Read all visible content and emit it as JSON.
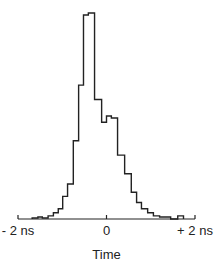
{
  "chart_data": {
    "type": "bar",
    "style": "step-histogram",
    "title": "",
    "xlabel": "Time",
    "ylabel": "",
    "xlim": [
      -2,
      2
    ],
    "ylim": [
      0,
      100
    ],
    "grid": false,
    "legend": "none",
    "x_unit": "ns",
    "x_ticks": [
      {
        "value": -2,
        "label": "- 2 ns"
      },
      {
        "value": 0,
        "label": "0"
      },
      {
        "value": 2,
        "label": "+ 2 ns"
      }
    ],
    "bins": [
      {
        "x0": -1.68,
        "x1": -1.55,
        "count": 0.5
      },
      {
        "x0": -1.55,
        "x1": -1.45,
        "count": 1
      },
      {
        "x0": -1.45,
        "x1": -1.32,
        "count": 0.5
      },
      {
        "x0": -1.32,
        "x1": -1.2,
        "count": 1.5
      },
      {
        "x0": -1.2,
        "x1": -1.09,
        "count": 3
      },
      {
        "x0": -1.09,
        "x1": -0.99,
        "count": 5
      },
      {
        "x0": -0.99,
        "x1": -0.88,
        "count": 11
      },
      {
        "x0": -0.88,
        "x1": -0.75,
        "count": 17
      },
      {
        "x0": -0.75,
        "x1": -0.63,
        "count": 38
      },
      {
        "x0": -0.63,
        "x1": -0.52,
        "count": 65
      },
      {
        "x0": -0.52,
        "x1": -0.41,
        "count": 99
      },
      {
        "x0": -0.41,
        "x1": -0.27,
        "count": 100
      },
      {
        "x0": -0.27,
        "x1": -0.11,
        "count": 58
      },
      {
        "x0": -0.11,
        "x1": 0.0,
        "count": 47
      },
      {
        "x0": 0.0,
        "x1": 0.11,
        "count": 50
      },
      {
        "x0": 0.11,
        "x1": 0.25,
        "count": 49
      },
      {
        "x0": 0.25,
        "x1": 0.41,
        "count": 31
      },
      {
        "x0": 0.41,
        "x1": 0.56,
        "count": 22
      },
      {
        "x0": 0.56,
        "x1": 0.68,
        "count": 13
      },
      {
        "x0": 0.68,
        "x1": 0.79,
        "count": 8
      },
      {
        "x0": 0.79,
        "x1": 0.93,
        "count": 5
      },
      {
        "x0": 0.93,
        "x1": 1.06,
        "count": 3
      },
      {
        "x0": 1.06,
        "x1": 1.2,
        "count": 1.5
      },
      {
        "x0": 1.2,
        "x1": 1.45,
        "count": 1
      },
      {
        "x0": 1.45,
        "x1": 1.61,
        "count": 0
      },
      {
        "x0": 1.61,
        "x1": 1.74,
        "count": 1.5
      }
    ]
  }
}
